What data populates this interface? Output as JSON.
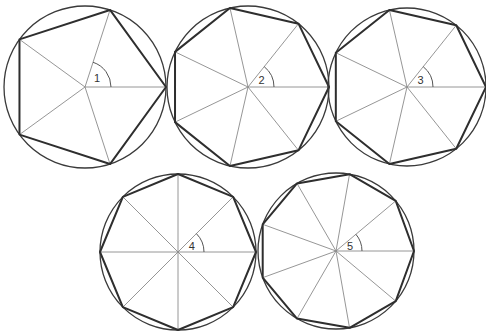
{
  "figure": {
    "stroke_colors": {
      "circle": "#3a3a3a",
      "polygon": "#2e2e2e",
      "spoke": "#8a8a8a"
    },
    "shapes": [
      {
        "id": "1",
        "label": "1",
        "sides": 5,
        "cx": 85,
        "cy": 87,
        "r": 81,
        "rotation_deg": 0
      },
      {
        "id": "2",
        "label": "2",
        "sides": 7,
        "cx": 248,
        "cy": 87,
        "r": 81,
        "rotation_deg": 0
      },
      {
        "id": "3",
        "label": "3",
        "sides": 7,
        "cx": 407,
        "cy": 87,
        "r": 79,
        "rotation_deg": 0
      },
      {
        "id": "4",
        "label": "4",
        "sides": 8,
        "cx": 178,
        "cy": 252,
        "r": 78,
        "rotation_deg": 0
      },
      {
        "id": "5",
        "label": "5",
        "sides": 9,
        "cx": 336,
        "cy": 251,
        "r": 78,
        "rotation_deg": 0
      }
    ]
  }
}
